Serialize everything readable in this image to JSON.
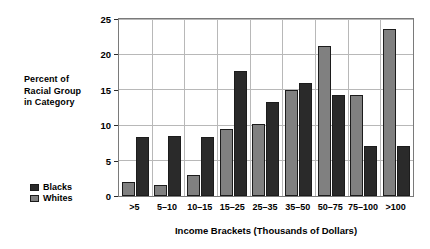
{
  "chart_data": {
    "type": "bar",
    "title": "",
    "xlabel": "Income Brackets (Thousands of Dollars)",
    "ylabel": "Percent of Racial Group in Category",
    "ylabel_lines": [
      "Percent of",
      "Racial Group",
      "in Category"
    ],
    "categories": [
      ">5",
      "5–10",
      "10–15",
      "15–25",
      "25–35",
      "35–50",
      "50–75",
      "75–100",
      ">100"
    ],
    "series": [
      {
        "name": "Whites",
        "color": "#808080",
        "values": [
          2.0,
          1.5,
          3.0,
          9.4,
          10.2,
          15.0,
          21.2,
          14.3,
          23.6
        ]
      },
      {
        "name": "Blacks",
        "color": "#2a2a2a",
        "values": [
          8.3,
          8.5,
          8.4,
          17.6,
          13.3,
          16.0,
          14.3,
          7.0,
          7.0
        ]
      }
    ],
    "legend": [
      {
        "label": "Blacks",
        "color": "#2a2a2a"
      },
      {
        "label": "Whites",
        "color": "#808080"
      }
    ],
    "legend_position": "left",
    "ylim": [
      0,
      25
    ],
    "yticks": [
      0,
      5,
      10,
      15,
      20,
      25
    ],
    "ytick_labels": [
      "0",
      "5",
      "10",
      "15",
      "20",
      "25"
    ],
    "grid": "both",
    "grid_color": "#b8b8b8",
    "frame_color": "#7a7a7a",
    "background": "#ffffff"
  }
}
